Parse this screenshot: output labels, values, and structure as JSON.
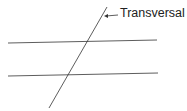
{
  "diagram": {
    "label": "Transversal",
    "line_color": "#333333",
    "lines": [
      {
        "name": "transversal",
        "x1": 107,
        "y1": 7,
        "x2": 49,
        "y2": 108
      },
      {
        "name": "parallel-line-top",
        "x1": 8,
        "y1": 43,
        "x2": 157,
        "y2": 40
      },
      {
        "name": "parallel-line-bottom",
        "x1": 8,
        "y1": 76,
        "x2": 158,
        "y2": 73
      }
    ],
    "arrow": {
      "from_x": 118,
      "from_y": 15,
      "to_x": 104,
      "to_y": 16
    }
  }
}
